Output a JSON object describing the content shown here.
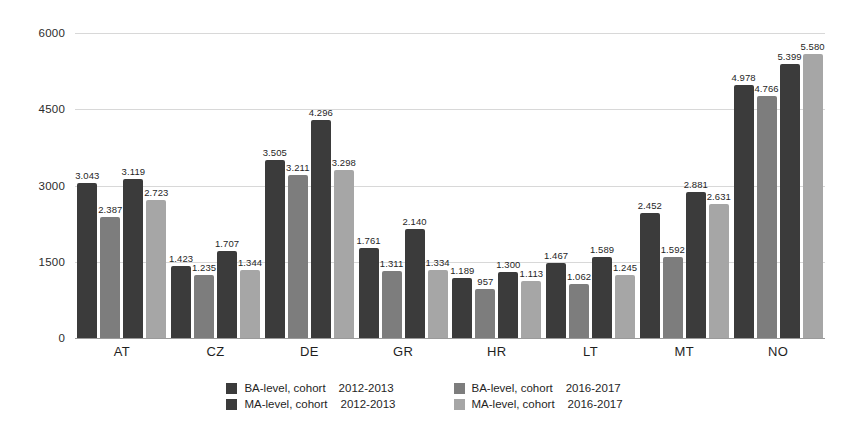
{
  "chart_data": {
    "type": "bar",
    "title": "",
    "subtitle": "",
    "xlabel": "",
    "ylabel": "",
    "ylim": [
      0,
      6000
    ],
    "yticks": [
      0,
      1500,
      3000,
      4500,
      6000
    ],
    "ytick_labels": [
      "0",
      "1500",
      "3000",
      "4500",
      "6000"
    ],
    "grid": true,
    "legend_position": "bottom",
    "categories": [
      "AT",
      "CZ",
      "DE",
      "GR",
      "HR",
      "LT",
      "MT",
      "NO"
    ],
    "series": [
      {
        "name": "BA-level, cohort 2012-2013",
        "level": "BA-level, cohort",
        "cohort": "2012-2013",
        "color": "#3b3b3b",
        "values": [
          3043,
          1423,
          3505,
          1761,
          1189,
          1467,
          2452,
          4978
        ],
        "labels": [
          "3.043",
          "1.423",
          "3.505",
          "1.761",
          "1.189",
          "1.467",
          "2.452",
          "4.978"
        ]
      },
      {
        "name": "BA-level, cohort 2016-2017",
        "level": "BA-level, cohort",
        "cohort": "2016-2017",
        "color": "#7d7d7d",
        "values": [
          2387,
          1235,
          3211,
          1311,
          957,
          1062,
          1592,
          4766
        ],
        "labels": [
          "2.387",
          "1.235",
          "3.211",
          "1.311",
          "957",
          "1.062",
          "1.592",
          "4.766"
        ]
      },
      {
        "name": "MA-level, cohort 2012-2013",
        "level": "MA-level, cohort",
        "cohort": "2012-2013",
        "color": "#3b3b3b",
        "values": [
          3119,
          1707,
          4296,
          2140,
          1300,
          1589,
          2881,
          5399
        ],
        "labels": [
          "3.119",
          "1.707",
          "4.296",
          "2.140",
          "1.300",
          "1.589",
          "2.881",
          "5.399"
        ]
      },
      {
        "name": "MA-level, cohort 2016-2017",
        "level": "MA-level, cohort",
        "cohort": "2016-2017",
        "color": "#a6a6a6",
        "values": [
          2723,
          1344,
          3298,
          1334,
          1113,
          1245,
          2631,
          5580
        ],
        "labels": [
          "2.723",
          "1.344",
          "3.298",
          "1.334",
          "1.113",
          "1.245",
          "2.631",
          "5.580"
        ]
      }
    ]
  },
  "legend": {
    "entries": [
      {
        "level": "BA-level, cohort",
        "cohort": "2012-2013",
        "swatch": "series-0-swatch"
      },
      {
        "level": "BA-level, cohort",
        "cohort": "2016-2017",
        "swatch": "series-1-swatch"
      },
      {
        "level": "MA-level, cohort",
        "cohort": "2012-2013",
        "swatch": "series-2-swatch"
      },
      {
        "level": "MA-level, cohort",
        "cohort": "2016-2017",
        "swatch": "series-3-swatch"
      }
    ]
  },
  "colors": {
    "series_dark": "#3b3b3b",
    "series_medium": "#7d7d7d",
    "series_light": "#a6a6a6",
    "gridline": "#d8d8d8",
    "axis": "#9a9a9a",
    "background": "#ffffff",
    "text": "#1f1f1f"
  }
}
